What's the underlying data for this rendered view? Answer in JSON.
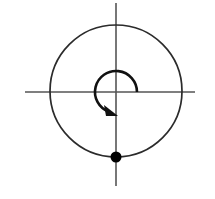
{
  "canvas": {
    "width": 215,
    "height": 199,
    "background": "#ffffff",
    "title": "Circular motion diagram with rotation arrow and point mass"
  },
  "style": {
    "axis_color": "#555555",
    "axis_stroke_width": 1.6,
    "circle_color": "#2b2b2b",
    "circle_stroke_width": 1.7,
    "arc_color": "#111111",
    "arc_stroke_width": 2.6,
    "dot_color": "#000000"
  },
  "geometry": {
    "origin": {
      "x": 116,
      "y": 92
    },
    "horizontal_axis": {
      "x1": 25,
      "y1": 92,
      "x2": 195,
      "y2": 92
    },
    "vertical_axis": {
      "x1": 116,
      "y1": 3,
      "x2": 116,
      "y2": 186
    },
    "outer_circle": {
      "cx": 116,
      "cy": 91,
      "r": 66
    },
    "rotation_arc": {
      "cx": 116,
      "cy": 92,
      "r": 21,
      "start_angle_deg": 0,
      "end_angle_deg": -70,
      "direction": "counterclockwise",
      "path": "M 137 92 A 21 21 0 1 0 108.8 111.7"
    },
    "arrowhead": {
      "tip_x": 118,
      "tip_y": 116,
      "points": "118,116 104,105 106,116"
    },
    "point_mass": {
      "cx": 116,
      "cy": 157,
      "r": 5.5
    }
  },
  "labels": {
    "origin_label": "",
    "axis_x_label": "",
    "axis_y_label": "",
    "point_label": ""
  },
  "elements": {
    "horizontal_axis_name": "horizontal-axis",
    "vertical_axis_name": "vertical-axis",
    "outer_circle_name": "orbit-circle",
    "rotation_arc_name": "rotation-arrow-arc",
    "arrowhead_name": "arrowhead-icon",
    "point_mass_name": "point-mass-dot"
  }
}
